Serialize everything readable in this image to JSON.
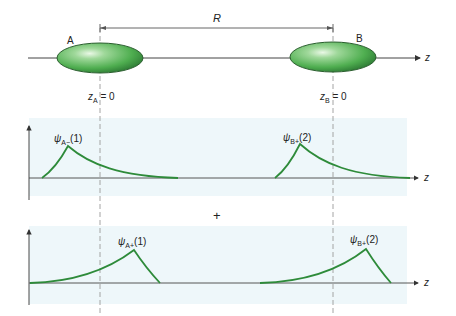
{
  "diagram": {
    "colors": {
      "curve": "#2e8b3a",
      "ellipse_light": "#c8ecc4",
      "ellipse_mid": "#58b858",
      "ellipse_dark": "#2d7a34",
      "panel_bg": "#eef7fa",
      "axis": "#333333",
      "dashed": "#999999"
    },
    "top": {
      "distance_label": "R",
      "nucleus_a_label": "A",
      "nucleus_b_label": "B",
      "axis_label": "z",
      "origin_a": {
        "var": "z",
        "sub": "A",
        "eq": " = 0"
      },
      "origin_b": {
        "var": "z",
        "sub": "B",
        "eq": " = 0"
      }
    },
    "panel1": {
      "axis_label": "z",
      "curve_a": {
        "psi": "ψ",
        "sub": "A−",
        "arg": "(1)"
      },
      "curve_b": {
        "psi": "ψ",
        "sub": "B+",
        "arg": "(2)"
      }
    },
    "operator": "+",
    "panel2": {
      "axis_label": "z",
      "curve_a": {
        "psi": "ψ",
        "sub": "A+",
        "arg": "(1)"
      },
      "curve_b": {
        "psi": "ψ",
        "sub": "B+",
        "arg": "(2)"
      }
    }
  }
}
